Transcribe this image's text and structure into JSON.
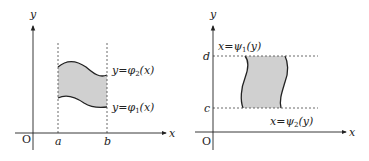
{
  "diagrams": [
    {
      "name": "type-1-region",
      "x_axis_label": "x",
      "y_axis_label": "y",
      "origin_label": "O",
      "bound_left_label": "a",
      "bound_right_label": "b",
      "upper_curve": {
        "lhs": "y",
        "eq": "=",
        "fn": "φ",
        "sub": "2",
        "arg": "(x)"
      },
      "lower_curve": {
        "lhs": "y",
        "eq": "=",
        "fn": "φ",
        "sub": "1",
        "arg": "(x)"
      },
      "fill_color": "#d0d0d0"
    },
    {
      "name": "type-2-region",
      "x_axis_label": "x",
      "y_axis_label": "y",
      "origin_label": "O",
      "bound_top_label": "d",
      "bound_bottom_label": "c",
      "left_curve": {
        "lhs": "x",
        "eq": "=",
        "fn": "ψ",
        "sub": "1",
        "arg": "(y)"
      },
      "right_curve": {
        "lhs": "x",
        "eq": "=",
        "fn": "ψ",
        "sub": "2",
        "arg": "(y)"
      },
      "fill_color": "#d0d0d0"
    }
  ]
}
